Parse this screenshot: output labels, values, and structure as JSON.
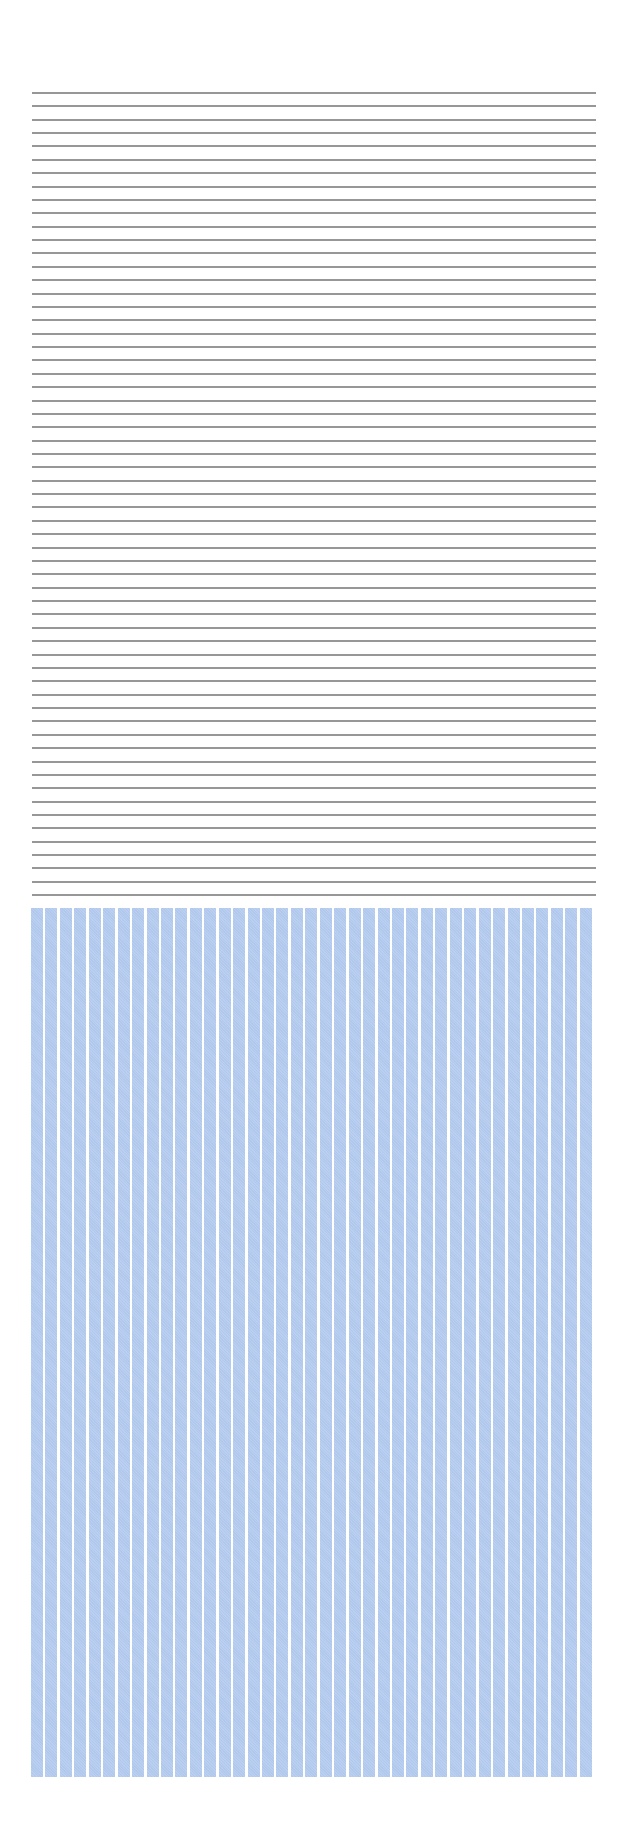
{
  "pattern": {
    "description": "Ruled horizontal gray lines above a block of vertical light-blue stripes",
    "horizontal_lines": {
      "count": 61,
      "color": "#8c8c8c",
      "start_y": 92,
      "spacing": 13.37,
      "left": 32,
      "width": 564,
      "thickness": 2
    },
    "vertical_stripes": {
      "count": 39,
      "color": "#b3caee",
      "gap_color": "#ffffff",
      "left": 31,
      "top": 908,
      "width": 563,
      "height": 869,
      "period": 14.44,
      "stripe_width": 12
    }
  }
}
